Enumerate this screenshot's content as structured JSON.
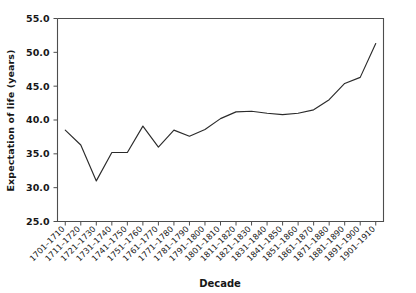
{
  "chart_data": {
    "type": "line",
    "title": "",
    "xlabel": "Decade",
    "ylabel": "Expectation of life (years)",
    "ylim": [
      25.0,
      55.0
    ],
    "yticks": [
      25.0,
      30.0,
      35.0,
      40.0,
      45.0,
      50.0,
      55.0
    ],
    "ytick_labels": [
      "25.0",
      "30.0",
      "35.0",
      "40.0",
      "45.0",
      "50.0",
      "55.0"
    ],
    "grid": false,
    "legend": null,
    "line_color": "#2b2b2b",
    "categories": [
      "1701–1710",
      "1711–1720",
      "1721–1730",
      "1731–1740",
      "1741–1750",
      "1751–1760",
      "1761–1770",
      "1771–1780",
      "1781–1790",
      "1791–1800",
      "1801–1810",
      "1811–1820",
      "1821–1830",
      "1831–1840",
      "1841–1850",
      "1851–1860",
      "1861–1870",
      "1871–1880",
      "1881–1890",
      "1891–1900",
      "1901–1910"
    ],
    "values": [
      38.5,
      36.3,
      31.0,
      35.2,
      35.2,
      39.1,
      36.0,
      38.5,
      37.6,
      38.6,
      40.2,
      41.2,
      41.3,
      41.0,
      40.8,
      41.0,
      41.5,
      43.0,
      45.4,
      46.3,
      51.3
    ],
    "series": [
      {
        "name": "Expectation of life",
        "values": [
          38.5,
          36.3,
          31.0,
          35.2,
          35.2,
          39.1,
          36.0,
          38.5,
          37.6,
          38.6,
          40.2,
          41.2,
          41.3,
          41.0,
          40.8,
          41.0,
          41.5,
          43.0,
          45.4,
          46.3,
          51.3
        ]
      }
    ]
  }
}
